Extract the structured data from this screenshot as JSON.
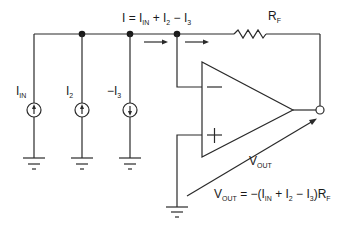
{
  "diagram": {
    "type": "summing-amplifier-circuit",
    "current_label": {
      "main": "I = I",
      "sub_in": "IN",
      "rest1": " + I",
      "sub_2": "2",
      "rest2": " − I",
      "sub_3": "3"
    },
    "resistor_label": {
      "main": "R",
      "sub": "F"
    },
    "sources": [
      {
        "id": "source-in",
        "label": "I",
        "sub": "IN",
        "direction": "up"
      },
      {
        "id": "source-2",
        "label": "I",
        "sub": "2",
        "direction": "up"
      },
      {
        "id": "source-3",
        "label": "−I",
        "sub": "3",
        "direction": "down"
      }
    ],
    "opamp": {
      "inverting_sign": "−",
      "noninverting_sign": "+"
    },
    "vout_label": {
      "main": "V",
      "sub": "OUT"
    },
    "equation": {
      "v": "V",
      "v_sub": "OUT",
      "p1": " = −(I",
      "s1": "IN",
      "p2": " + I",
      "s2": "2",
      "p3": " − I",
      "s3": "3",
      "p4": ")R",
      "s4": "F"
    },
    "colors": {
      "wire": "#2a2a2a",
      "background": "#ffffff"
    }
  }
}
